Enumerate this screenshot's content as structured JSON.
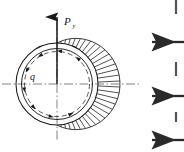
{
  "figure": {
    "background_color": "#ffffff",
    "line_color": "#1a1a1a",
    "width": 184,
    "height": 152
  },
  "labels": {
    "load_symbol": "P",
    "load_subscript": "y",
    "shear_flow_symbol": "q"
  },
  "geometry": {
    "center_x": 57,
    "center_y": 84,
    "outer_radius": 41,
    "inner_radius": 35,
    "dashed_radius": 33
  },
  "load_arrow": {
    "name": "vertical-load-arrow",
    "x": 57,
    "tip_y": 15,
    "tail_y": 84,
    "direction": "up"
  },
  "axes": {
    "horizontal_centerline": {
      "x1": 2,
      "x2": 140,
      "y": 84,
      "style": "dash-dot"
    },
    "vertical_centerline": {
      "x": 57,
      "y1": 20,
      "y2": 140,
      "style": "dash-dot"
    }
  },
  "shear_flow": {
    "name": "shear-flow-dashed-circle",
    "style": "dashed",
    "arrowhead_count": 8,
    "direction": "counter-clockwise"
  },
  "pressure_distribution": {
    "name": "radial-pressure-hatching",
    "description": "Radial hatch lines on the right side, maximum length at the horizontal midline, tapering to zero at top and bottom",
    "line_count": 33,
    "angle_start_deg": -90,
    "angle_end_deg": 90,
    "max_extension": 22,
    "side": "right"
  },
  "side_arrows": {
    "name": "adjacent-figure-arrows",
    "direction": "left",
    "count": 3,
    "items": [
      {
        "x_tip": 152,
        "x_tail": 184,
        "y": 42
      },
      {
        "x_tip": 152,
        "x_tail": 184,
        "y": 96
      },
      {
        "x_tip": 152,
        "x_tail": 184,
        "y": 140
      }
    ],
    "partial_top": {
      "x": 176,
      "y_top": 0,
      "y_bottom": 14
    },
    "partial_mid": {
      "x": 176,
      "y_top": 62,
      "y_bottom": 76
    },
    "partial_low": {
      "x": 176,
      "y_top": 112,
      "y_bottom": 122
    }
  }
}
